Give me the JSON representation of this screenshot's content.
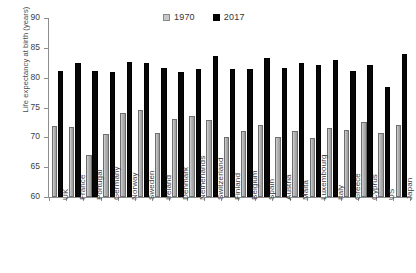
{
  "chart_data": {
    "type": "bar",
    "title": "",
    "xlabel": "",
    "ylabel": "Life expectancy at birth (years)",
    "ylim": [
      60,
      90
    ],
    "y_ticks": [
      60,
      65,
      70,
      75,
      80,
      85,
      90
    ],
    "grid": false,
    "legend_position": "top-right",
    "categories": [
      "UK",
      "France",
      "Portugal",
      "Germany",
      "Norway",
      "Sweden",
      "Ireland",
      "Denmark",
      "Netherlands",
      "Switzerland",
      "Finland",
      "Belgium",
      "Spain",
      "Austria",
      "Malta",
      "Luxembourg",
      "Italy",
      "Greece",
      "Cyprus",
      "US",
      "Japan"
    ],
    "series": [
      {
        "name": "1970",
        "color": "#b5b5b5",
        "values": [
          71.9,
          71.7,
          67.1,
          70.5,
          74.0,
          74.6,
          70.8,
          73.1,
          73.5,
          72.9,
          70.0,
          71.0,
          72.0,
          70.0,
          71.0,
          69.9,
          71.6,
          71.3,
          72.5,
          70.8,
          72.0
        ]
      },
      {
        "name": "2017",
        "color": "#000000",
        "values": [
          81.2,
          82.5,
          81.1,
          80.9,
          82.6,
          82.4,
          81.6,
          80.9,
          81.5,
          83.6,
          81.4,
          81.5,
          83.3,
          81.7,
          82.4,
          82.1,
          82.9,
          81.2,
          82.2,
          78.5,
          83.9
        ]
      }
    ]
  },
  "legend": {
    "entries": [
      {
        "label": "1970",
        "swatch": "light-gray-square"
      },
      {
        "label": "2017",
        "swatch": "black-square"
      }
    ]
  },
  "axis": {
    "y_title": "Life expectancy at birth (years)",
    "y_tick_labels": [
      "90",
      "85",
      "80",
      "75",
      "70",
      "65",
      "60"
    ]
  }
}
